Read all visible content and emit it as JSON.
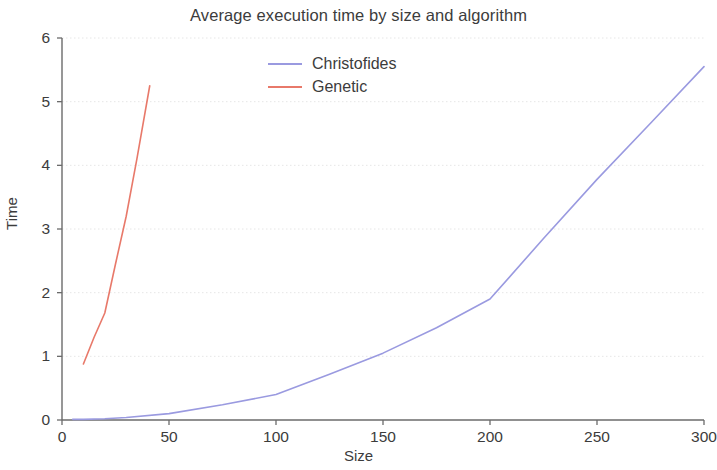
{
  "chart_data": {
    "type": "line",
    "title": "Average execution time by size and algorithm",
    "xlabel": "Size",
    "ylabel": "Time",
    "xlim": [
      0,
      300
    ],
    "ylim": [
      0,
      6
    ],
    "xticks": [
      0,
      50,
      100,
      150,
      200,
      250,
      300
    ],
    "yticks": [
      0,
      1,
      2,
      3,
      4,
      5,
      6
    ],
    "xtick_labels": [
      "0",
      "50",
      "100",
      "150",
      "200",
      "250",
      "300"
    ],
    "ytick_labels": [
      "0",
      "1",
      "2",
      "3",
      "4",
      "5",
      "6"
    ],
    "grid": true,
    "legend_position": "top-center",
    "series": [
      {
        "name": "Christofides",
        "color": "#9a9ae0",
        "x": [
          5,
          10,
          20,
          30,
          50,
          75,
          100,
          125,
          150,
          175,
          200,
          225,
          250,
          275,
          300
        ],
        "y": [
          0.01,
          0.01,
          0.02,
          0.04,
          0.1,
          0.24,
          0.4,
          0.72,
          1.05,
          1.45,
          1.9,
          2.85,
          3.78,
          4.66,
          5.55
        ]
      },
      {
        "name": "Genetic",
        "color": "#e8796a",
        "x": [
          10,
          15,
          20,
          25,
          30,
          35,
          41
        ],
        "y": [
          0.88,
          1.3,
          1.68,
          2.45,
          3.2,
          4.1,
          5.25
        ]
      }
    ]
  },
  "colors": {
    "background": "#ffffff",
    "axis": "#6b6b6b",
    "grid": "#e6e6e6",
    "text": "#3c3c3c"
  }
}
